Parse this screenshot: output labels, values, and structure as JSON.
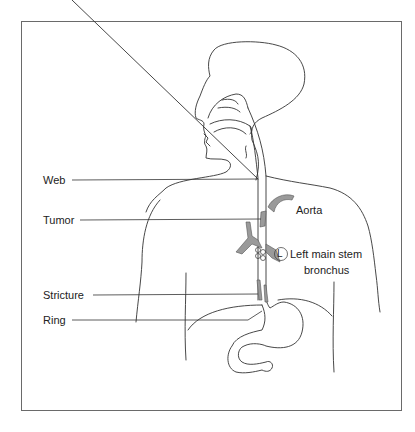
{
  "diagram": {
    "type": "anatomical-illustration",
    "labels": {
      "web": "Web",
      "tumor": "Tumor",
      "stricture": "Stricture",
      "ring": "Ring",
      "aorta": "Aorta",
      "bronchus_marker": "L",
      "bronchus_line1": "Left main stem",
      "bronchus_line2": "bronchus"
    },
    "colors": {
      "outline": "#333333",
      "highlight_gray": "#9a9a9a",
      "frame": "#6a6a6a",
      "background": "#ffffff"
    }
  }
}
